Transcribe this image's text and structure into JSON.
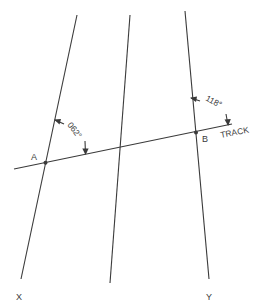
{
  "diagram": {
    "meridians": [
      {
        "id": "X",
        "label": "X",
        "x1": 77,
        "y1": 15,
        "x2": 21,
        "y2": 279
      },
      {
        "id": "middle",
        "label": "",
        "x1": 130,
        "y1": 15,
        "x2": 110,
        "y2": 283
      },
      {
        "id": "Y",
        "label": "Y",
        "x1": 185,
        "y1": 11,
        "x2": 209,
        "y2": 279
      }
    ],
    "track": {
      "label": "TRACK",
      "x1": 14,
      "y1": 169,
      "x2": 232,
      "y2": 124
    },
    "points": [
      {
        "label": "A",
        "x": 45.5,
        "y": 162.8
      },
      {
        "label": "B",
        "x": 196,
        "y": 132.6
      }
    ],
    "angles": [
      {
        "label": "062°",
        "at": "A"
      },
      {
        "label": "118°",
        "at": "B"
      }
    ],
    "colors": {
      "line": "#3a3a3a",
      "background": "#ffffff"
    }
  }
}
